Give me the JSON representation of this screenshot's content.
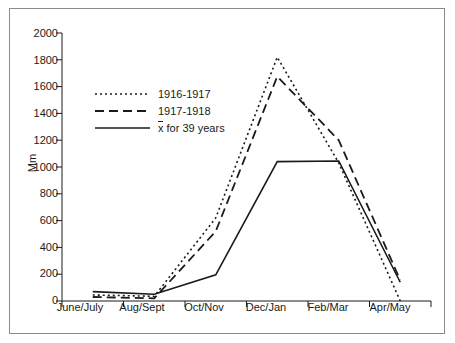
{
  "chart_data": {
    "type": "line",
    "title": "",
    "xlabel": "",
    "ylabel": "Mm",
    "categories": [
      "June/July",
      "Aug/Sept",
      "Oct/Nov",
      "Dec/Jan",
      "Feb/Mar",
      "Apr/May"
    ],
    "ylim": [
      0,
      2000
    ],
    "yticks": [
      0,
      200,
      400,
      600,
      800,
      1000,
      1200,
      1400,
      1600,
      1800,
      2000
    ],
    "ytick_labels": [
      "0",
      "200",
      "400",
      "600",
      "800",
      "1000",
      "1200",
      "1400",
      "1600",
      "1800",
      "2000"
    ],
    "grid": false,
    "legend_position": "upper-left-inside",
    "series": [
      {
        "name": "1916-1917",
        "style": "dotted",
        "color": "#1a1a1a",
        "values": [
          45,
          35,
          620,
          1820,
          1030,
          0
        ]
      },
      {
        "name": "1917-1918",
        "style": "dashed",
        "color": "#1a1a1a",
        "values": [
          30,
          20,
          520,
          1675,
          1200,
          155
        ]
      },
      {
        "name": "x̄ for 39 years",
        "style": "solid",
        "color": "#1a1a1a",
        "values": [
          70,
          50,
          195,
          1040,
          1045,
          140
        ]
      }
    ]
  },
  "legend": {
    "items": [
      {
        "label": "1916-1917"
      },
      {
        "label": "1917-1918"
      },
      {
        "label_prefix": "x",
        "label_suffix": " for 39 years",
        "label": "x̄ for 39 years"
      }
    ]
  }
}
